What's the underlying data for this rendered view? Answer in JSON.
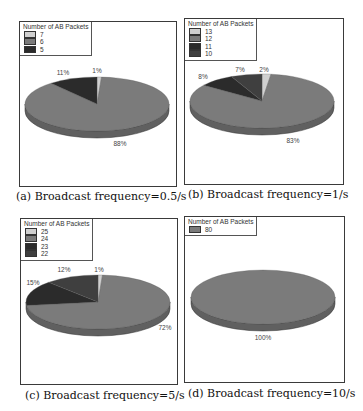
{
  "chart_data": [
    {
      "type": "pie",
      "id": "a",
      "title": "",
      "caption": "(a) Broadcast frequency=0.5/s",
      "legend_title": "Number of AB Packets",
      "categories": [
        "7",
        "6",
        "5"
      ],
      "values": [
        1,
        88,
        11
      ],
      "labels": [
        "1%",
        "88%",
        "11%"
      ],
      "colors": [
        "#d0d0d0",
        "#7b7b7b",
        "#2b2b2b"
      ],
      "legend_position": "top-left"
    },
    {
      "type": "pie",
      "id": "b",
      "title": "",
      "caption": "(b) Broadcast frequency=1/s",
      "legend_title": "Number of AB Packets",
      "categories": [
        "13",
        "12",
        "11",
        "10"
      ],
      "values": [
        2,
        83,
        8,
        7
      ],
      "labels": [
        "2%",
        "83%",
        "8%",
        "7%"
      ],
      "colors": [
        "#d0d0d0",
        "#7b7b7b",
        "#2b2b2b",
        "#3f3f3f"
      ],
      "legend_position": "top-left"
    },
    {
      "type": "pie",
      "id": "c",
      "title": "",
      "caption": "(c) Broadcast frequency=5/s",
      "legend_title": "Number of AB Packets",
      "categories": [
        "25",
        "24",
        "23",
        "22"
      ],
      "values": [
        1,
        72,
        15,
        12
      ],
      "labels": [
        "1%",
        "72%",
        "15%",
        "12%"
      ],
      "colors": [
        "#d0d0d0",
        "#7b7b7b",
        "#2b2b2b",
        "#3f3f3f"
      ],
      "legend_position": "top-left"
    },
    {
      "type": "pie",
      "id": "d",
      "title": "",
      "caption": "(d) Broadcast frequency=10/s",
      "legend_title": "Number of AB Packets",
      "categories": [
        "80"
      ],
      "values": [
        100
      ],
      "labels": [
        "100%"
      ],
      "colors": [
        "#7b7b7b"
      ],
      "legend_position": "top-left"
    }
  ],
  "layout": {
    "panels": [
      {
        "frame": [
          19,
          21,
          158,
          166
        ],
        "pie": [
          97,
          104,
          72,
          27,
          7
        ],
        "caption_xy": [
          16,
          200
        ],
        "label_pos": [
          [
            97,
            73
          ],
          [
            120,
            146
          ],
          [
            63,
            75
          ]
        ]
      },
      {
        "frame": [
          184,
          18,
          160,
          167
        ],
        "pie": [
          262,
          101,
          72,
          27,
          7
        ],
        "caption_xy": [
          188,
          198
        ],
        "label_pos": [
          [
            264,
            72
          ],
          [
            293,
            143
          ],
          [
            203,
            79
          ],
          [
            240,
            72
          ]
        ]
      },
      {
        "frame": [
          20,
          218,
          158,
          167
        ],
        "pie": [
          98,
          302,
          72,
          27,
          7
        ],
        "caption_xy": [
          25,
          399
        ],
        "label_pos": [
          [
            99,
            272
          ],
          [
            165,
            330
          ],
          [
            33,
            285
          ],
          [
            64,
            272
          ]
        ]
      },
      {
        "frame": [
          184,
          216,
          161,
          167
        ],
        "pie": [
          263,
          297,
          72,
          27,
          7
        ],
        "caption_xy": [
          188,
          397
        ],
        "label_pos": [
          [
            263,
            340
          ]
        ]
      }
    ]
  }
}
